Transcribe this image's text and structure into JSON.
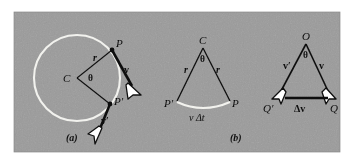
{
  "figure": {
    "kind": "physics-diagram",
    "topic": "Uniform circular motion: velocity change and centripetal acceleration",
    "panel_count": 3,
    "background_color": "#9b9b9b",
    "ink_color": "#101010",
    "highlight_color": "#f2f2ee",
    "arrowhead_fill": "#ffffff"
  },
  "panel_a": {
    "caption": "(a)",
    "center_label": "C",
    "angle_label": "θ",
    "radius_label": "r",
    "radius_label_2": "r",
    "point_upper_label": "P",
    "point_lower_label": "P′",
    "velocity_upper_label": "v",
    "velocity_lower_label": "v′",
    "circle": {
      "cx": 77,
      "cy": 78,
      "r": 43,
      "stroke": "#f2f2ee"
    },
    "center_point": {
      "x": 77,
      "y": 78
    },
    "point_upper": {
      "x": 112,
      "y": 50
    },
    "point_lower": {
      "x": 110,
      "y": 104
    },
    "velocity_upper_tip": {
      "x": 137,
      "y": 91
    },
    "velocity_lower_tip": {
      "x": 97,
      "y": 140
    }
  },
  "panel_b": {
    "caption": "(b)",
    "apex_label": "C",
    "angle_label": "θ",
    "left_side_label": "r",
    "right_side_label": "r",
    "left_vertex_label": "P′",
    "right_vertex_label": "P",
    "arc_label": "v Δt",
    "apex": {
      "x": 203,
      "y": 44
    },
    "left_vertex": {
      "x": 176,
      "y": 103
    },
    "right_vertex": {
      "x": 231,
      "y": 103
    },
    "arc_stroke": "#f2f2ee"
  },
  "panel_c": {
    "caption": "(c)",
    "apex_label": "O",
    "angle_label": "θ",
    "left_vector_label": "v′",
    "right_vector_label": "v",
    "left_vertex_label": "Q′",
    "right_vertex_label": "Q",
    "base_label": "Δv",
    "apex": {
      "x": 306,
      "y": 40
    },
    "left_vertex": {
      "x": 274,
      "y": 98
    },
    "right_vertex": {
      "x": 332,
      "y": 98
    }
  }
}
